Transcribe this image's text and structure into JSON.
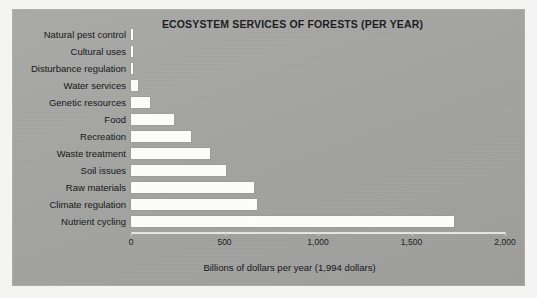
{
  "figure": {
    "background_color": "#f4f4f3",
    "panel_color": "#a6a6a5",
    "bar_color": "#fdfdfb",
    "text_color": "#141414"
  },
  "chart_data": {
    "type": "bar",
    "orientation": "horizontal",
    "title": "ECOSYSTEM SERVICES OF FORESTS (PER YEAR)",
    "xlabel": "Billions of dollars per year (1,994 dollars)",
    "ylabel": "",
    "xlim": [
      0,
      2000
    ],
    "grid": false,
    "legend": null,
    "xticks": [
      0,
      500,
      1000,
      1500,
      2000
    ],
    "xtick_labels": [
      "0",
      "500",
      "1,000",
      "1,500",
      "2,000"
    ],
    "categories": [
      "Natural pest control",
      "Cultural uses",
      "Disturbance regulation",
      "Water services",
      "Genetic resources",
      "Food",
      "Recreation",
      "Waste treatment",
      "Soil issues",
      "Raw materials",
      "Climate regulation",
      "Nutrient cycling"
    ],
    "values": [
      8,
      8,
      10,
      35,
      100,
      230,
      320,
      420,
      510,
      660,
      675,
      1725
    ],
    "units": "billions of US dollars per year (1994 dollars)"
  }
}
